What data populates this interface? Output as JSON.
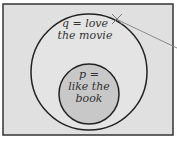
{
  "diagram": {
    "type": "venn",
    "colors": {
      "background": "#ffffff",
      "universe_fill": "#e0e0e0",
      "border": "#333333",
      "outer_fill": "#e4e4e4",
      "inner_fill": "#c8c8c8",
      "pointer": "#8a8a8a"
    },
    "outer_set": {
      "line1": "q = love",
      "line2": "the movie"
    },
    "inner_set": {
      "line1": "p =",
      "line2": "like the",
      "line3": "book"
    }
  }
}
